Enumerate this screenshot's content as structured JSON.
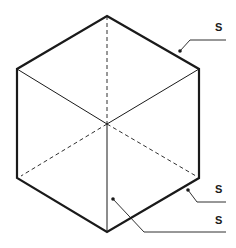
{
  "diagram": {
    "type": "isometric-cube",
    "colors": {
      "stroke": "#1a1a1a",
      "background": "#ffffff"
    },
    "labels": [
      {
        "id": "label-top-edge",
        "text": "S",
        "target": "upper-right outer edge"
      },
      {
        "id": "label-bottom-edge",
        "text": "S",
        "target": "lower-right outer edge"
      },
      {
        "id": "label-front-face",
        "text": "S",
        "target": "lower-front face"
      }
    ]
  }
}
